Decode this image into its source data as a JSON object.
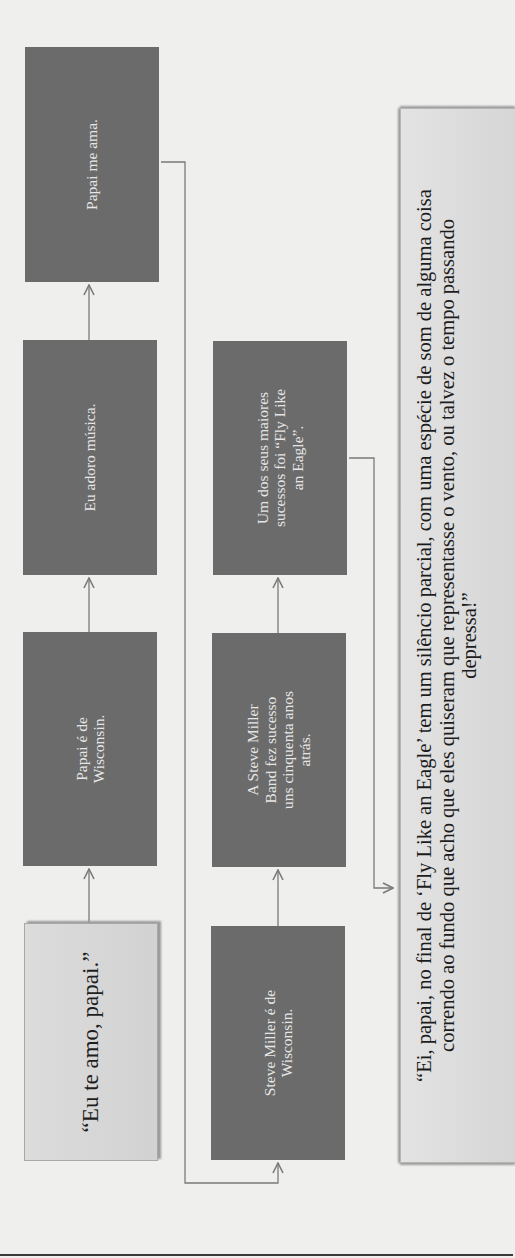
{
  "diagram": {
    "title": "",
    "colors": {
      "background": "#efefed",
      "dark_box": "#6b6b6b",
      "dark_box_text": "#e6e6e6",
      "light_box": "#d6d6d6",
      "connector": "#7a7a7a"
    },
    "start_node": {
      "id": "eu-te-amo",
      "text": "“Eu te amo, papai.”"
    },
    "row1": [
      {
        "id": "papai-wisconsin",
        "text": "Papai é de Wisconsin."
      },
      {
        "id": "eu-adoro-musica",
        "text": "Eu adoro música."
      },
      {
        "id": "papai-me-ama",
        "text": "Papai me ama."
      }
    ],
    "row2": [
      {
        "id": "steve-miller-wisconsin",
        "text": "Steve Miller é de Wisconsin."
      },
      {
        "id": "steve-miller-band",
        "text": "A Steve Miller Band fez sucesso uns cinquenta anos atrás."
      },
      {
        "id": "fly-like-an-eagle",
        "text": "Um dos seus maiores sucessos foi “Fly Like an Eagle”."
      }
    ],
    "quote": {
      "id": "final-quote",
      "text": "“Ei, papai, no final de ‘Fly Like an Eagle’ tem um silêncio parcial, com uma espécie de som de alguma coisa correndo ao fundo que acho que eles quiseram que representasse o vento, ou talvez o tempo passando depressa!”"
    },
    "edges": [
      {
        "from": "eu-te-amo",
        "to": "papai-wisconsin"
      },
      {
        "from": "papai-wisconsin",
        "to": "eu-adoro-musica"
      },
      {
        "from": "eu-adoro-musica",
        "to": "papai-me-ama"
      },
      {
        "from": "papai-me-ama",
        "to": "steve-miller-wisconsin"
      },
      {
        "from": "steve-miller-wisconsin",
        "to": "steve-miller-band"
      },
      {
        "from": "steve-miller-band",
        "to": "fly-like-an-eagle"
      },
      {
        "from": "fly-like-an-eagle",
        "to": "final-quote"
      }
    ],
    "orientation": "rotated 90° counter-clockwise"
  }
}
